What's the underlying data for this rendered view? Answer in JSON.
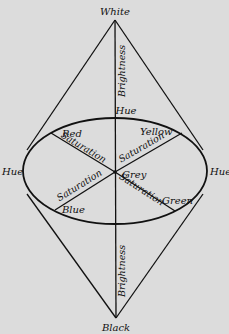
{
  "diagram": {
    "vertices": {
      "top": "White",
      "bottom": "Black"
    },
    "center": "Grey",
    "hue_labels": {
      "top": "Hue",
      "left": "Hue",
      "right": "Hue"
    },
    "axis_labels": {
      "upper_brightness": "Brightness",
      "lower_brightness": "Brightness"
    },
    "colors": [
      {
        "name": "Red",
        "position": "upper-left",
        "axis_label": "Saturation"
      },
      {
        "name": "Yellow",
        "position": "upper-right",
        "axis_label": "Saturation"
      },
      {
        "name": "Blue",
        "position": "lower-left",
        "axis_label": "Saturation"
      },
      {
        "name": "Green",
        "position": "lower-right",
        "axis_label": "Saturation"
      }
    ],
    "style": {
      "background": "#dcdcdc",
      "ink": "#111111"
    }
  }
}
